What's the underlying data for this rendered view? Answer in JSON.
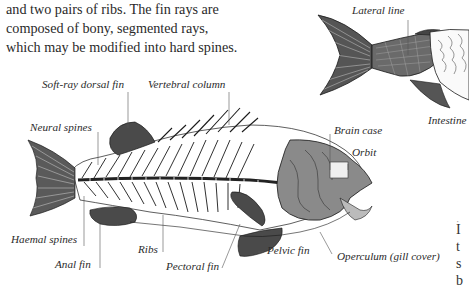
{
  "paragraph": {
    "lines": [
      "and two pairs of ribs. The fin rays are",
      "composed of bony, segmented rays,",
      "which may be modified into hard spines."
    ]
  },
  "skeleton_labels": {
    "soft_ray_dorsal_fin": "Soft-ray dorsal fin",
    "vertebral_column": "Vertebral column",
    "neural_spines": "Neural spines",
    "brain_case": "Brain case",
    "orbit": "Orbit",
    "haemal_spines": "Haemal spines",
    "ribs": "Ribs",
    "anal_fin": "Anal fin",
    "pectoral_fin": "Pectoral fin",
    "pelvic_fin": "Pelvic fin",
    "operculum": "Operculum (gill cover)"
  },
  "anatomy_labels": {
    "lateral_line": "Lateral line",
    "intestine": "Intestine"
  },
  "right_edge_fragments": [
    "·",
    "I",
    "t",
    "s",
    "b"
  ]
}
